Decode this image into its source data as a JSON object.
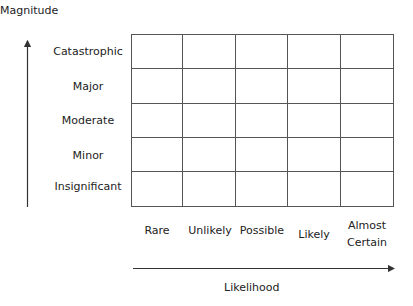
{
  "y_axis": {
    "title": "Magnitude",
    "levels": [
      "Catastrophic",
      "Major",
      "Moderate",
      "Minor",
      "Insignificant"
    ]
  },
  "x_axis": {
    "title": "Likelihood",
    "levels": [
      "Rare",
      "Unlikely",
      "Possible",
      "Likely",
      "Almost Certain"
    ]
  },
  "matrix": {
    "rows": 5,
    "cols": 5,
    "cells": [
      [
        "",
        "",
        "",
        "",
        ""
      ],
      [
        "",
        "",
        "",
        "",
        ""
      ],
      [
        "",
        "",
        "",
        "",
        ""
      ],
      [
        "",
        "",
        "",
        "",
        ""
      ],
      [
        "",
        "",
        "",
        "",
        ""
      ]
    ]
  },
  "colors": {
    "grid_line": "#555555",
    "text": "#222222",
    "arrow": "#333333"
  }
}
